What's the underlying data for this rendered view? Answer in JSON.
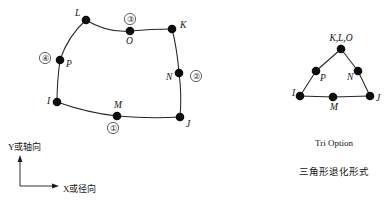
{
  "figure": {
    "background_color": "#ffffff",
    "ink_color": "#1a1a1a",
    "node_color": "#0d0d0d"
  },
  "quad_element": {
    "name": "eight-node-quadrilateral-element",
    "corner_nodes": [
      {
        "id": "I",
        "label": "I",
        "x": 57,
        "y": 102,
        "label_x": 47,
        "label_y": 104
      },
      {
        "id": "J",
        "label": "J",
        "x": 180,
        "y": 117,
        "label_x": 186,
        "label_y": 127
      },
      {
        "id": "K",
        "label": "K",
        "x": 172,
        "y": 29,
        "label_x": 180,
        "label_y": 28
      },
      {
        "id": "L",
        "label": "L",
        "x": 86,
        "y": 20,
        "label_x": 75,
        "label_y": 16
      }
    ],
    "midside_nodes": [
      {
        "id": "M",
        "label": "M",
        "x": 117,
        "y": 116,
        "label_x": 114,
        "label_y": 108
      },
      {
        "id": "N",
        "label": "N",
        "x": 179,
        "y": 73,
        "label_x": 166,
        "label_y": 80
      },
      {
        "id": "O",
        "label": "O",
        "x": 130,
        "y": 31,
        "label_x": 126,
        "label_y": 44
      },
      {
        "id": "P",
        "label": "P",
        "x": 60,
        "y": 60,
        "label_x": 66,
        "label_y": 67
      }
    ],
    "face_markers": [
      {
        "id": "face-1",
        "label": "①",
        "cx": 113,
        "cy": 128
      },
      {
        "id": "face-2",
        "label": "②",
        "cx": 196,
        "cy": 76
      },
      {
        "id": "face-3",
        "label": "③",
        "cx": 130,
        "cy": 19
      },
      {
        "id": "face-4",
        "label": "④",
        "cx": 45,
        "cy": 58
      }
    ],
    "edge_paths": {
      "bottom_I_M_J": "M 57 102 Q 88 113 117 116 Q 150 119 180 117",
      "right_J_N_K": "M 180 117 Q 182 95 179 73 Q 177 48 172 29",
      "top_K_O_L": "M 172 29 Q 151 29 130 31 Q 107 33 86 20",
      "left_L_P_I": "M 86 20 Q 68 36 60 60 Q 57 82 57 102"
    }
  },
  "tri_element": {
    "name": "degenerate-triangular-element",
    "collapsed_node": {
      "id": "KLO",
      "label": "K,L,O",
      "x": 341,
      "y": 49,
      "label_x": 341,
      "label_y": 41
    },
    "corner_nodes": [
      {
        "id": "I",
        "label": "I",
        "x": 300,
        "y": 96,
        "label_x": 292,
        "label_y": 96
      },
      {
        "id": "J",
        "label": "J",
        "x": 370,
        "y": 96,
        "label_x": 376,
        "label_y": 101
      }
    ],
    "midside_nodes": [
      {
        "id": "P",
        "label": "P",
        "x": 316,
        "y": 71,
        "label_x": 320,
        "label_y": 81
      },
      {
        "id": "N",
        "label": "N",
        "x": 358,
        "y": 71,
        "label_x": 347,
        "label_y": 80
      },
      {
        "id": "M",
        "label": "M",
        "x": 333,
        "y": 97,
        "label_x": 330,
        "label_y": 110
      }
    ],
    "edge_paths": {
      "left_I_P_KLO": "M 300 96 L 316 71 L 341 49",
      "right_KLO_N_J": "M 341 49 L 358 71 L 370 96",
      "bottom_I_M_J": "M 300 96 L 333 97 L 370 96"
    }
  },
  "axes": {
    "name": "coordinate-axes",
    "origin": {
      "x": 20,
      "y": 186
    },
    "y_axis": {
      "label": "Y或轴向",
      "symbol": "Y",
      "text_x": 8,
      "text_y": 150,
      "tip_y": 158
    },
    "x_axis": {
      "label": "X或径向",
      "symbol": "X",
      "text_x": 63,
      "text_y": 192,
      "tip_x": 56
    }
  },
  "captions": {
    "english": "Tri Option",
    "chinese": "三角形退化形式",
    "english_x": 334,
    "english_y": 146,
    "chinese_x": 334,
    "chinese_y": 175
  }
}
